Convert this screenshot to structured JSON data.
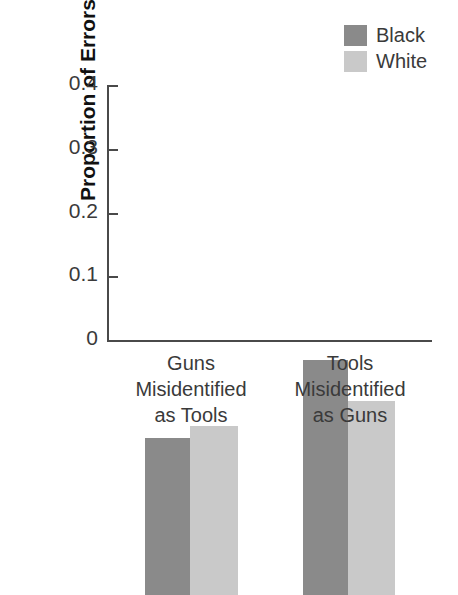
{
  "chart_data": {
    "type": "bar",
    "title": "",
    "xlabel": "",
    "ylabel": "Proportion of Errors",
    "ylim": [
      0,
      0.4
    ],
    "yticks": [
      "0",
      "0.1",
      "0.2",
      "0.3",
      "0.4"
    ],
    "ytick_values": [
      0,
      0.1,
      0.2,
      0.3,
      0.4
    ],
    "grid": false,
    "legend_position": "top-right",
    "categories": [
      "Guns\nMisidentified\nas Tools",
      "Tools\nMisidentified\nas Guns"
    ],
    "category_lines": [
      [
        "Guns",
        "Misidentified",
        "as Tools"
      ],
      [
        "Tools",
        "Misidentified",
        "as Guns"
      ]
    ],
    "series": [
      {
        "name": "Black",
        "color": "#8a8a8a",
        "values": [
          0.247,
          0.369
        ]
      },
      {
        "name": "White",
        "color": "#c9c9c9",
        "values": [
          0.265,
          0.305
        ]
      }
    ]
  },
  "legend": {
    "items": [
      {
        "label": "Black",
        "color": "#8a8a8a"
      },
      {
        "label": "White",
        "color": "#c9c9c9"
      }
    ]
  },
  "axis": {
    "y_title": "Proportion of Errors",
    "ticks": [
      {
        "label": "0.4",
        "value": 0.4
      },
      {
        "label": "0.3",
        "value": 0.3
      },
      {
        "label": "0.2",
        "value": 0.2
      },
      {
        "label": "0.1",
        "value": 0.1
      },
      {
        "label": "0",
        "value": 0
      }
    ]
  },
  "categories": [
    {
      "line1": "Guns",
      "line2": "Misidentified",
      "line3": "as Tools"
    },
    {
      "line1": "Tools",
      "line2": "Misidentified",
      "line3": "as Guns"
    }
  ],
  "colors": {
    "black_series": "#8a8a8a",
    "white_series": "#c9c9c9",
    "axis": "#4a4a4a",
    "text": "#3a3a3a",
    "background": "#ffffff"
  }
}
